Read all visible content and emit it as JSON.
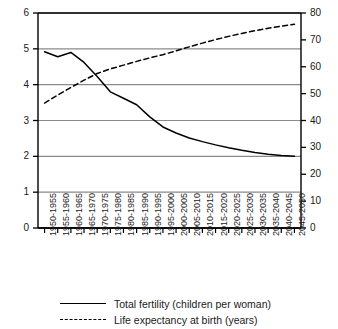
{
  "chart_data": {
    "type": "line",
    "title": "",
    "xlabel": "",
    "ylabel": "",
    "y2label": "",
    "grid": true,
    "legend_position": "bottom",
    "categories": [
      "1950-1955",
      "1955-1960",
      "1960-1965",
      "1965-1970",
      "1970-1975",
      "1975-1980",
      "1980-1985",
      "1985-1990",
      "1990-1995",
      "1995-2000",
      "2000-2005",
      "2005-2010",
      "2010-2015",
      "2015-2020",
      "2020-2025",
      "2025-2030",
      "2030-2035",
      "2035-2040",
      "2040-2045",
      "2045-2050"
    ],
    "axes": {
      "left": {
        "min": 0,
        "max": 6,
        "step": 1,
        "ticks": [
          "0",
          "1",
          "2",
          "3",
          "4",
          "5",
          "6"
        ]
      },
      "right": {
        "min": 0,
        "max": 80,
        "step": 10,
        "ticks": [
          "0",
          "10",
          "20",
          "30",
          "40",
          "50",
          "60",
          "70",
          "80"
        ]
      }
    },
    "series": [
      {
        "name": "Total fertility (children per woman)",
        "axis": "left",
        "style": "solid",
        "color": "#000000",
        "values": [
          4.92,
          4.78,
          4.9,
          4.62,
          4.23,
          3.8,
          3.62,
          3.44,
          3.1,
          2.82,
          2.65,
          2.51,
          2.41,
          2.32,
          2.24,
          2.17,
          2.11,
          2.06,
          2.02,
          2.0
        ]
      },
      {
        "name": "Life expectancy at birth (years)",
        "axis": "right",
        "style": "dashed",
        "color": "#000000",
        "values": [
          46.5,
          49.5,
          52.3,
          55.0,
          57.5,
          59.2,
          60.6,
          62.0,
          63.3,
          64.5,
          65.9,
          67.4,
          68.8,
          70.1,
          71.3,
          72.4,
          73.4,
          74.3,
          75.1,
          75.8
        ]
      }
    ]
  },
  "legend": {
    "entries": [
      {
        "label": "Total fertility (children per woman)",
        "style": "solid"
      },
      {
        "label": "Life expectancy at birth (years)",
        "style": "dashed"
      }
    ]
  }
}
